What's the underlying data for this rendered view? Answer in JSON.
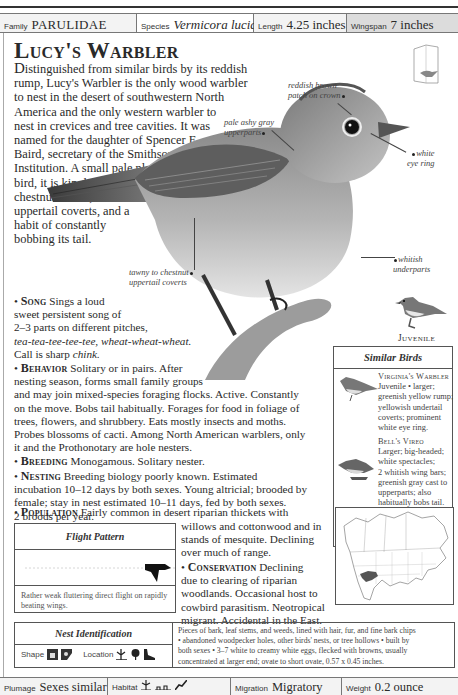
{
  "header": {
    "family": {
      "label": "Family",
      "value": "PARULIDAE"
    },
    "species": {
      "label": "Species",
      "value": "Vermicora luciae"
    },
    "length": {
      "label": "Length",
      "value": "4.25 inches"
    },
    "wingspan": {
      "label": "Wingspan",
      "value": "7 inches"
    }
  },
  "title": "Lucy's Warbler",
  "intro": {
    "lead": "D",
    "lines": [
      "istinguished from similar birds by its reddish",
      "rump, Lucy's Warbler is the only wood warbler",
      "to nest in the desert of southwestern North",
      "America and the only western warbler to",
      "nest in crevices and tree cavities. It was",
      "named for the daughter of Spencer F.",
      "Baird, secretary of the Smithsonian",
      "Institution. A small pale plain gray",
      "bird, it is kinglet-sized and has a",
      "chestnut crown, chestnut",
      "uppertail coverts, and a",
      "habit of constantly",
      "bobbing its tail."
    ]
  },
  "callouts": {
    "crown": [
      "reddish brown",
      "patch on crown"
    ],
    "upperparts": [
      "pale ashy gray",
      "upperparts"
    ],
    "eye_ring": [
      "white",
      "eye ring"
    ],
    "underparts": [
      "whitish",
      "underparts"
    ],
    "coverts": [
      "tawny to chestnut",
      "uppertail coverts"
    ]
  },
  "juvenile_label": "Juvenile",
  "song": {
    "heading": "Song",
    "lines": [
      "Sings a loud",
      "sweet persistent song of",
      "2–3 parts on different pitches,"
    ],
    "phrase": "tea-tea-tee-tee-tee, wheat-wheat-wheat.",
    "call_prefix": "Call is sharp ",
    "call": "chink."
  },
  "behavior": {
    "heading": "Behavior",
    "lines": [
      "Solitary or in pairs. After",
      "nesting season, forms small family groups",
      "and may join mixed-species foraging flocks. Active. Constantly",
      "on the move. Bobs tail habitually. Forages for food in foliage of",
      "trees, flowers, and shrubbery. Eats mostly insects and moths.",
      "Probes blossoms of cacti. Among North American warblers, only",
      "it and the Prothonotary are hole nesters."
    ]
  },
  "breeding": {
    "heading": "Breeding",
    "text": "Monogamous. Solitary nester."
  },
  "nesting": {
    "heading": "Nesting",
    "lines": [
      "Breeding biology poorly known. Estimated",
      "incubation 10–12 days by both sexes. Young altricial; brooded by",
      "female; stay in nest estimated 10–11 days, fed by both sexes.",
      "2 broods per year."
    ]
  },
  "population": {
    "heading": "Population",
    "lines": [
      "Fairly common in desert riparian thickets with",
      "willows and cottonwood and in",
      "stands of mesquite. Declining",
      "over much of range."
    ]
  },
  "conservation": {
    "heading": "Conservation",
    "lines": [
      "Declining",
      "due to clearing of riparian",
      "woodlands. Occasional host to",
      "cowbird parasitism. Neotropical",
      "migrant. Accidental in the East."
    ]
  },
  "similar_birds": {
    "title": "Similar Birds",
    "items": [
      {
        "name": "Virginia's Warbler",
        "lines": [
          "Juvenile • larger;",
          "greenish yellow rump;",
          "yellowish undertail",
          "coverts; prominent",
          "white eye ring."
        ]
      },
      {
        "name": "Bell's Vireo",
        "lines": [
          "Larger; big-headed;",
          "white spectacles;",
          "2 whitish wing bars;",
          "greenish gray cast to",
          "upperparts; also",
          "habitually bobs tail."
        ]
      }
    ]
  },
  "flight_pattern": {
    "title": "Flight Pattern",
    "description": "Rather weak fluttering direct flight on rapidly beating wings."
  },
  "nest_identification": {
    "title": "Nest Identification",
    "shape_label": "Shape",
    "location_label": "Location",
    "lines": [
      "Pieces of bark, leaf stems, and weeds, lined with hair, fur, and fine bark chips",
      "• abandoned woodpecker holes, other birds' nests, or tree hollows • built by",
      "both sexes • 3–7 white to creamy white eggs, flecked with browns, usually",
      "concentrated at larger end; ovate to short ovate, 0.57 x 0.45 inches."
    ]
  },
  "footer": {
    "plumage": {
      "label": "Plumage",
      "value": "Sexes similar"
    },
    "habitat": {
      "label": "Habitat"
    },
    "migration": {
      "label": "Migration",
      "value": "Migratory"
    },
    "weight": {
      "label": "Weight",
      "value": "0.2 ounce"
    }
  },
  "colors": {
    "rule": "#333333",
    "wingspan_bg": "#dcdcdc",
    "cell_bg": "#f3f3f3",
    "range": "#555555"
  }
}
